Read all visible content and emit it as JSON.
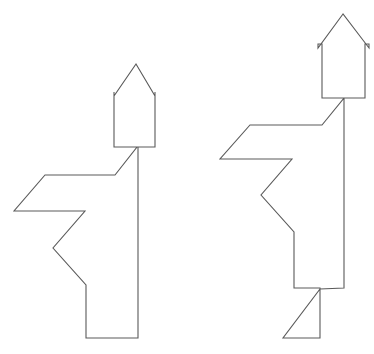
{
  "canvas": {
    "width": 374,
    "height": 354,
    "background_color": "#ffffff",
    "title": "Two outlined arrow-headed stick figures"
  },
  "style": {
    "stroke_color": "#5a5a5a",
    "stroke_width": 1.1,
    "fill": "none"
  },
  "chart_data": {
    "type": "scatter",
    "xlabel": "",
    "ylabel": "",
    "xlim": [
      0,
      374
    ],
    "ylim": [
      0,
      354
    ],
    "grid": false,
    "legend": "none",
    "shapes": [
      {
        "name": "left-figure",
        "label": "Left figure with upward arrow head",
        "closed": true,
        "points": [
          [
            136,
            64
          ],
          [
            114,
            96
          ],
          [
            114,
            92
          ],
          [
            114,
            147
          ],
          [
            137,
            147
          ],
          [
            115,
            175
          ],
          [
            45,
            175
          ],
          [
            14,
            211
          ],
          [
            85,
            211
          ],
          [
            53,
            248
          ],
          [
            86,
            285
          ],
          [
            86,
            338
          ],
          [
            138,
            338
          ],
          [
            138,
            147
          ],
          [
            155,
            147
          ],
          [
            155,
            92
          ],
          [
            155,
            96
          ],
          [
            136,
            64
          ]
        ]
      },
      {
        "name": "right-figure",
        "label": "Right figure with upward arrow head and triangular foot",
        "closed": true,
        "points": [
          [
            343,
            14
          ],
          [
            318,
            48
          ],
          [
            318,
            44
          ],
          [
            322,
            44
          ],
          [
            322,
            98
          ],
          [
            344,
            98
          ],
          [
            322,
            125
          ],
          [
            250,
            125
          ],
          [
            220,
            159
          ],
          [
            292,
            159
          ],
          [
            261,
            195
          ],
          [
            294,
            232
          ],
          [
            294,
            288
          ],
          [
            320,
            288
          ],
          [
            320,
            338
          ],
          [
            283,
            338
          ],
          [
            320,
            289
          ],
          [
            344,
            288
          ],
          [
            344,
            98
          ],
          [
            365,
            98
          ],
          [
            365,
            44
          ],
          [
            369,
            44
          ],
          [
            369,
            48
          ],
          [
            343,
            14
          ]
        ]
      }
    ]
  },
  "left_figure": {
    "name": "left-figure",
    "arrow_head": {
      "name": "left-arrow-head",
      "tip": [
        136,
        64
      ],
      "base_left": [
        114,
        96
      ],
      "base_right": [
        155,
        96
      ]
    },
    "arrow_shaft": {
      "name": "left-arrow-shaft",
      "left_x": 114,
      "right_x": 155,
      "top_y": 92,
      "bottom_y": 147
    },
    "body_path": "M137,147 L115,175 L45,175 L14,211 L85,211 L53,248 L86,285 L86,338 L138,338 L138,147",
    "arm_path": "M115,175 L45,175 L14,211 L85,211",
    "leg_path": "M53,248 L86,285 L86,338 L138,338"
  },
  "right_figure": {
    "name": "right-figure",
    "arrow_head": {
      "name": "right-arrow-head",
      "tip": [
        343,
        14
      ],
      "base_left": [
        318,
        48
      ],
      "base_right": [
        369,
        48
      ]
    },
    "arrow_shaft": {
      "name": "right-arrow-shaft",
      "left_x": 322,
      "right_x": 365,
      "top_y": 44,
      "bottom_y": 98
    },
    "body_path": "M344,98 L322,125 L250,125 L220,159 L292,159 L261,195 L294,232 L294,288 L344,288 L344,98",
    "arm_path": "M322,125 L250,125 L220,159 L292,159",
    "foot_path": "M320,288 L320,338 L283,338 Z"
  }
}
